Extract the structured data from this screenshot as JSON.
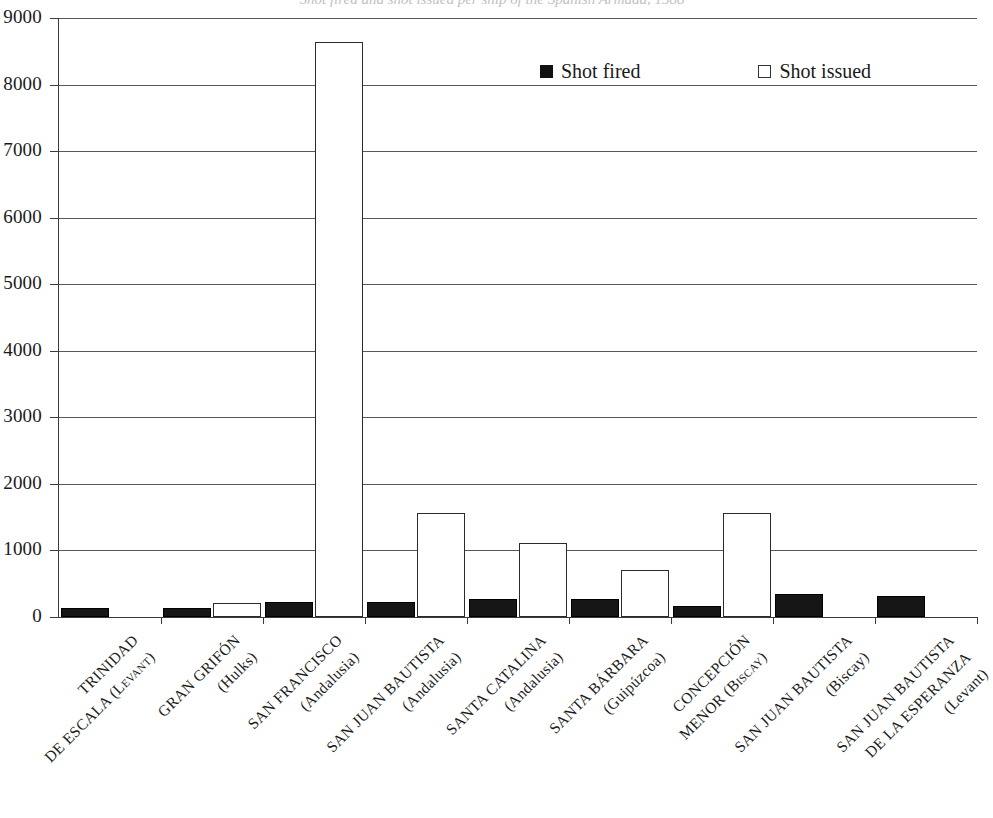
{
  "title": "Shot fired and shot issued per ship of the Spanish Armada, 1588",
  "legend": {
    "position": "top-center-right",
    "items": [
      {
        "label": "Shot fired",
        "swatch": "filled-square-swatch",
        "color": "#111111"
      },
      {
        "label": "Shot issued",
        "swatch": "hollow-square-swatch",
        "color": "#ffffff"
      }
    ]
  },
  "chart_data": {
    "type": "bar",
    "title": "Shot fired and shot issued per ship of the Spanish Armada, 1588",
    "xlabel": "",
    "ylabel": "",
    "ylim": [
      0,
      9000
    ],
    "yticks": [
      0,
      1000,
      2000,
      3000,
      4000,
      5000,
      6000,
      7000,
      8000,
      9000
    ],
    "ytick_labels": [
      "0",
      "1000",
      "2000",
      "3000",
      "4000",
      "5000",
      "6000",
      "7000",
      "8000",
      "9000"
    ],
    "grid": true,
    "legend": [
      "Shot fired",
      "Shot issued"
    ],
    "categories": [
      "TRINIDAD DE ESCALA (Levant)",
      "GRAN GRIFÓN (Hulks)",
      "SAN FRANCISCO (Andalusia)",
      "SAN JUAN BAUTISTA (Andalusia)",
      "SANTA CATALINA (Andalusia)",
      "SANTA BÁRBARA (Guipúzcoa)",
      "CONCEPCIÓN MENOR (Biscay)",
      "SAN JUAN BAUTISTA (Biscay)",
      "SAN JUAN BAUTISTA DE LA ESPERANZA (Levant)"
    ],
    "category_lines": [
      [
        "TRINIDAD",
        "DE ESCALA (Levant)"
      ],
      [
        "GRAN GRIFÓN",
        "(Hulks)"
      ],
      [
        "SAN FRANCISCO",
        "(Andalusia)"
      ],
      [
        "SAN JUAN BAUTISTA",
        "(Andalusia)"
      ],
      [
        "SANTA CATALINA",
        "(Andalusia)"
      ],
      [
        "SANTA BÁRBARA",
        "(Guipúzcoa)"
      ],
      [
        "CONCEPCIÓN",
        "MENOR (Biscay)"
      ],
      [
        "SAN JUAN BAUTISTA",
        "(Biscay)"
      ],
      [
        "SAN JUAN BAUTISTA",
        "DE LA ESPERANZA",
        "(Levant)"
      ]
    ],
    "series": [
      {
        "name": "Shot fired",
        "values": [
          140,
          130,
          230,
          230,
          270,
          270,
          170,
          350,
          320
        ]
      },
      {
        "name": "Shot issued",
        "values": [
          0,
          210,
          8640,
          1560,
          1110,
          710,
          1560,
          0,
          0
        ]
      }
    ]
  }
}
